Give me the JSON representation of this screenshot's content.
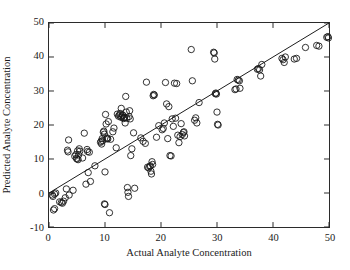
{
  "chart_data": {
    "type": "scatter",
    "title": "",
    "xlabel": "Actual Analyte Concentration",
    "ylabel": "Predicted Analyte Concentration",
    "xlim": [
      0,
      50
    ],
    "ylim": [
      -10,
      50
    ],
    "xticks": [
      0,
      10,
      20,
      30,
      40,
      50
    ],
    "yticks": [
      -10,
      0,
      10,
      20,
      30,
      40,
      50
    ],
    "xtick_labels": [
      "0",
      "10",
      "20",
      "30",
      "40",
      "50"
    ],
    "ytick_labels": [
      "-10",
      "0",
      "10",
      "20",
      "30",
      "40",
      "50"
    ],
    "grid": false,
    "legend": null,
    "marker": "open-circle",
    "marker_color": "#1a1a1a",
    "marker_size": 4.2,
    "reference_line": {
      "name": "identity-line",
      "type": "line",
      "x": [
        0,
        50
      ],
      "y": [
        0,
        50
      ],
      "color": "#1a1a1a",
      "width": 1
    },
    "series": [
      {
        "name": "samples",
        "points": [
          [
            0.6,
            -0.6
          ],
          [
            0.7,
            -1.0
          ],
          [
            0.8,
            -5.0
          ],
          [
            1.0,
            -4.6
          ],
          [
            1.0,
            -0.3
          ],
          [
            1.2,
            0.0
          ],
          [
            1.9,
            -2.6
          ],
          [
            2.2,
            -2.8
          ],
          [
            2.4,
            -3.0
          ],
          [
            2.6,
            -2.4
          ],
          [
            2.9,
            -1.4
          ],
          [
            3.1,
            1.2
          ],
          [
            3.3,
            12.6
          ],
          [
            3.4,
            12.1
          ],
          [
            3.5,
            15.6
          ],
          [
            3.6,
            -0.6
          ],
          [
            4.3,
            0.8
          ],
          [
            4.6,
            10.8
          ],
          [
            4.8,
            11.3
          ],
          [
            4.9,
            10.2
          ],
          [
            5.0,
            10.0
          ],
          [
            5.1,
            12.4
          ],
          [
            5.2,
            9.8
          ],
          [
            5.3,
            11.2
          ],
          [
            5.4,
            13.0
          ],
          [
            5.5,
            12.3
          ],
          [
            6.0,
            10.3
          ],
          [
            6.3,
            17.6
          ],
          [
            6.6,
            2.6
          ],
          [
            6.8,
            12.8
          ],
          [
            6.9,
            12.2
          ],
          [
            7.0,
            6.0
          ],
          [
            7.2,
            12.0
          ],
          [
            7.4,
            3.4
          ],
          [
            8.2,
            8.0
          ],
          [
            9.2,
            14.9
          ],
          [
            9.3,
            15.2
          ],
          [
            9.4,
            14.4
          ],
          [
            9.5,
            16.0
          ],
          [
            9.6,
            15.4
          ],
          [
            9.7,
            17.9
          ],
          [
            9.8,
            18.2
          ],
          [
            9.9,
            17.3
          ],
          [
            9.9,
            -3.2
          ],
          [
            10.0,
            -3.4
          ],
          [
            10.0,
            6.2
          ],
          [
            10.1,
            23.1
          ],
          [
            10.2,
            20.3
          ],
          [
            10.3,
            16.0
          ],
          [
            10.4,
            16.2
          ],
          [
            10.5,
            15.9
          ],
          [
            10.6,
            21.0
          ],
          [
            10.8,
            -5.8
          ],
          [
            11.0,
            15.8
          ],
          [
            11.4,
            18.0
          ],
          [
            11.6,
            19.1
          ],
          [
            12.0,
            13.3
          ],
          [
            12.2,
            23.2
          ],
          [
            12.4,
            22.6
          ],
          [
            12.6,
            22.9
          ],
          [
            12.7,
            23.4
          ],
          [
            12.8,
            22.3
          ],
          [
            12.9,
            24.9
          ],
          [
            13.0,
            22.4
          ],
          [
            13.1,
            23.0
          ],
          [
            13.2,
            22.8
          ],
          [
            13.3,
            21.9
          ],
          [
            13.4,
            22.1
          ],
          [
            13.5,
            22.2
          ],
          [
            13.6,
            20.6
          ],
          [
            13.7,
            28.4
          ],
          [
            13.8,
            23.8
          ],
          [
            13.9,
            22.0
          ],
          [
            14.0,
            1.6
          ],
          [
            14.1,
            0.2
          ],
          [
            14.2,
            -1.0
          ],
          [
            14.3,
            22.5
          ],
          [
            14.4,
            24.2
          ],
          [
            14.5,
            21.8
          ],
          [
            14.6,
            11.0
          ],
          [
            14.8,
            13.0
          ],
          [
            15.1,
            17.7
          ],
          [
            15.3,
            1.4
          ],
          [
            16.4,
            16.2
          ],
          [
            16.8,
            15.2
          ],
          [
            17.2,
            14.6
          ],
          [
            17.4,
            32.6
          ],
          [
            17.6,
            7.6
          ],
          [
            17.8,
            7.4
          ],
          [
            18.0,
            7.8
          ],
          [
            18.1,
            8.0
          ],
          [
            18.2,
            6.4
          ],
          [
            18.3,
            5.6
          ],
          [
            18.4,
            9.2
          ],
          [
            18.5,
            8.4
          ],
          [
            18.6,
            28.6
          ],
          [
            18.7,
            29.0
          ],
          [
            18.8,
            28.8
          ],
          [
            19.2,
            16.4
          ],
          [
            19.6,
            19.8
          ],
          [
            20.2,
            18.6
          ],
          [
            20.4,
            19.0
          ],
          [
            20.6,
            20.6
          ],
          [
            20.8,
            32.5
          ],
          [
            21.0,
            26.2
          ],
          [
            21.2,
            16.0
          ],
          [
            21.4,
            25.4
          ],
          [
            21.6,
            11.0
          ],
          [
            21.8,
            10.9
          ],
          [
            22.0,
            21.8
          ],
          [
            22.2,
            19.6
          ],
          [
            22.4,
            32.3
          ],
          [
            22.6,
            22.0
          ],
          [
            22.8,
            32.2
          ],
          [
            23.0,
            17.0
          ],
          [
            23.2,
            14.8
          ],
          [
            23.4,
            16.6
          ],
          [
            23.6,
            20.4
          ],
          [
            23.8,
            17.2
          ],
          [
            24.0,
            17.8
          ],
          [
            24.1,
            18.0
          ],
          [
            24.2,
            16.8
          ],
          [
            25.4,
            42.2
          ],
          [
            25.6,
            33.0
          ],
          [
            26.0,
            21.4
          ],
          [
            26.2,
            22.1
          ],
          [
            26.4,
            20.6
          ],
          [
            26.8,
            26.6
          ],
          [
            29.4,
            41.4
          ],
          [
            29.5,
            41.2
          ],
          [
            29.6,
            39.4
          ],
          [
            29.7,
            29.2
          ],
          [
            29.8,
            29.4
          ],
          [
            29.9,
            29.1
          ],
          [
            30.0,
            23.8
          ],
          [
            30.1,
            20.2
          ],
          [
            30.2,
            20.0
          ],
          [
            33.2,
            30.4
          ],
          [
            33.4,
            30.6
          ],
          [
            33.6,
            33.4
          ],
          [
            33.8,
            33.2
          ],
          [
            34.0,
            33.0
          ],
          [
            34.1,
            30.8
          ],
          [
            37.2,
            36.4
          ],
          [
            37.4,
            36.6
          ],
          [
            37.6,
            36.2
          ],
          [
            37.8,
            34.4
          ],
          [
            38.0,
            37.8
          ],
          [
            41.6,
            39.6
          ],
          [
            41.8,
            39.2
          ],
          [
            42.0,
            38.4
          ],
          [
            42.2,
            40.0
          ],
          [
            43.8,
            39.4
          ],
          [
            44.2,
            39.6
          ],
          [
            45.8,
            42.8
          ],
          [
            47.8,
            43.4
          ],
          [
            48.2,
            43.2
          ],
          [
            49.6,
            45.8
          ],
          [
            49.8,
            46.0
          ],
          [
            49.9,
            45.6
          ]
        ]
      }
    ]
  }
}
